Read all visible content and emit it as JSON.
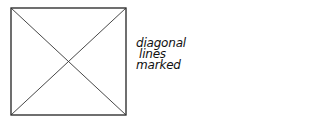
{
  "diagram": {
    "shape": "square",
    "square": {
      "x1": 11,
      "y1": 8,
      "x2": 126,
      "y2": 115
    },
    "stroke_color": "#222222",
    "diagonals": 2,
    "label_lines": [
      "diagonal",
      "lines",
      "marked"
    ]
  }
}
